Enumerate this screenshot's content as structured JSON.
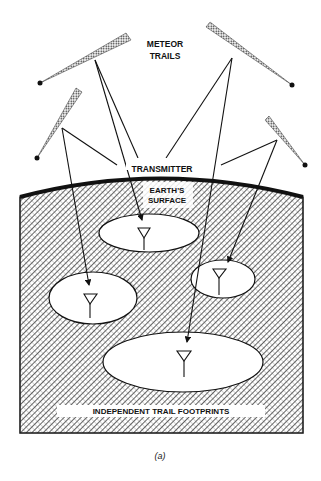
{
  "diagram": {
    "labels": {
      "meteor_line1": "METEOR",
      "meteor_line2": "TRAILS",
      "transmitter": "TRANSMITTER",
      "earth_line1": "EARTH'S",
      "earth_line2": "SURFACE",
      "footprints": "INDEPENDENT TRAIL FOOTPRINTS",
      "caption": "(a)"
    },
    "colors": {
      "ink": "#111111",
      "background": "#ffffff"
    },
    "elements": {
      "meteor_trails": 4,
      "receiver_footprints": 4
    }
  }
}
